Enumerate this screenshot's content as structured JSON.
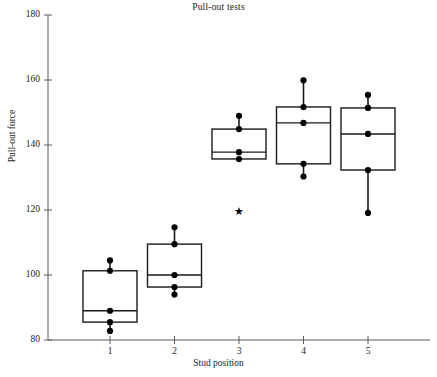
{
  "chart_data": {
    "type": "box",
    "title": "Pull-out tests",
    "xlabel": "Stud position",
    "ylabel": "Pull-out force",
    "grid": false,
    "legend": "none",
    "xlim": [
      0.4,
      5.8
    ],
    "ylim": [
      80,
      180
    ],
    "yticks": [
      80,
      100,
      120,
      140,
      160,
      180
    ],
    "ytick_labels": [
      "80",
      "100",
      "120",
      "140",
      "160",
      "180"
    ],
    "xticks": [
      1,
      2,
      3,
      4,
      5
    ],
    "xtick_labels": [
      "1",
      "2",
      "3",
      "4",
      "5"
    ],
    "categories": [
      "1",
      "2",
      "3",
      "4",
      "5"
    ],
    "boxes": [
      {
        "category": "1",
        "whisker_low": 82.8,
        "q1": 85.5,
        "median": 89.0,
        "q3": 101.3,
        "whisker_high": 104.5,
        "points": [
          104.5,
          101.3,
          89.0,
          85.5,
          82.8
        ],
        "outliers": []
      },
      {
        "category": "2",
        "whisker_low": 94.0,
        "q1": 96.3,
        "median": 100.0,
        "q3": 109.5,
        "whisker_high": 114.7,
        "points": [
          114.7,
          109.5,
          100.0,
          96.3,
          94.0
        ],
        "outliers": []
      },
      {
        "category": "3",
        "whisker_low": 135.7,
        "q1": 135.7,
        "median": 137.8,
        "q3": 144.9,
        "whisker_high": 149.0,
        "points": [
          149.0,
          144.9,
          137.8,
          135.7
        ],
        "outliers": [
          119.5
        ]
      },
      {
        "category": "4",
        "whisker_low": 130.3,
        "q1": 134.2,
        "median": 146.8,
        "q3": 151.7,
        "whisker_high": 159.9,
        "points": [
          159.9,
          151.7,
          146.8,
          134.2,
          130.3
        ],
        "outliers": []
      },
      {
        "category": "5",
        "whisker_low": 119.1,
        "q1": 132.3,
        "median": 143.4,
        "q3": 151.4,
        "whisker_high": 155.4,
        "points": [
          155.4,
          151.4,
          143.4,
          132.3,
          119.1
        ],
        "outliers": []
      }
    ],
    "colors": {
      "box_stroke": "#1a1a1a",
      "point_fill": "#000000",
      "axis": "#5a5a5a",
      "text": "#222222",
      "background": "#ffffff"
    }
  }
}
